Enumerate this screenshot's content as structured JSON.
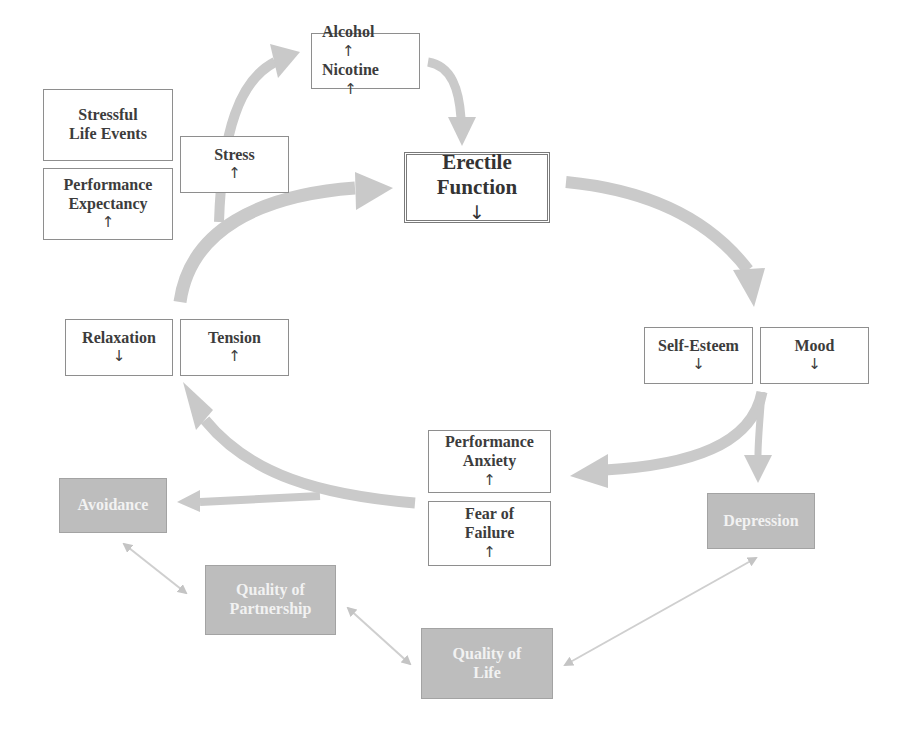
{
  "colors": {
    "arrow_fill": "#c9c9c9",
    "light_box_border": "#8e8e8e",
    "dark_box_fill": "#bdbdbd",
    "dark_box_text": "#f2f2f2",
    "text": "#3c3c3c"
  },
  "nodes": {
    "alcohol_nicotine": {
      "line1": "Alcohol",
      "line1_sym": "↑",
      "line2": "Nicotine",
      "line2_sym": "↑"
    },
    "stressful_life_events": {
      "line1": "Stressful",
      "line2": "Life Events"
    },
    "performance_expectancy": {
      "line1": "Performance",
      "line2": "Expectancy",
      "line2_sym": "↑"
    },
    "stress": {
      "line1": "Stress",
      "line2_sym": "↑"
    },
    "erectile_function": {
      "line1": "Erectile",
      "line2": "Function",
      "line2_sym": "↓"
    },
    "relaxation": {
      "line1": "Relaxation",
      "line2_sym": "↓"
    },
    "tension": {
      "line1": "Tension",
      "line2_sym": "↑"
    },
    "self_esteem": {
      "line1": "Self-Esteem",
      "line2_sym": "↓"
    },
    "mood": {
      "line1": "Mood",
      "line2_sym": "↓"
    },
    "performance_anxiety": {
      "line1": "Performance",
      "line2": "Anxiety",
      "line2_sym": "↑"
    },
    "fear_of_failure": {
      "line1": "Fear of",
      "line2": "Failure",
      "line2_sym": "↑"
    },
    "avoidance": {
      "line1": "Avoidance"
    },
    "depression": {
      "line1": "Depression"
    },
    "quality_of_partnership": {
      "line1": "Quality of",
      "line2": "Partnership"
    },
    "quality_of_life": {
      "line1": "Quality of",
      "line2": "Life"
    }
  },
  "edges": [
    {
      "from": "stress",
      "to": "alcohol_nicotine",
      "type": "thick-arrow"
    },
    {
      "from": "alcohol_nicotine",
      "to": "erectile_function",
      "type": "thick-arrow"
    },
    {
      "from": "erectile_function",
      "to": "self_esteem_mood",
      "type": "thick-arrow"
    },
    {
      "from": "self_esteem_mood",
      "to": "performance_anxiety_fear",
      "type": "thick-arrow"
    },
    {
      "from": "self_esteem_mood",
      "to": "depression",
      "type": "thick-arrow"
    },
    {
      "from": "performance_anxiety_fear",
      "to": "relaxation_tension",
      "type": "thick-arrow"
    },
    {
      "from": "performance_anxiety_fear",
      "to": "avoidance",
      "type": "thick-arrow"
    },
    {
      "from": "relaxation_tension",
      "to": "erectile_function",
      "type": "thick-arrow"
    },
    {
      "from": "avoidance",
      "to": "quality_of_partnership",
      "type": "thin-double-arrow"
    },
    {
      "from": "quality_of_partnership",
      "to": "quality_of_life",
      "type": "thin-double-arrow"
    },
    {
      "from": "quality_of_life",
      "to": "depression",
      "type": "thin-double-arrow"
    }
  ]
}
